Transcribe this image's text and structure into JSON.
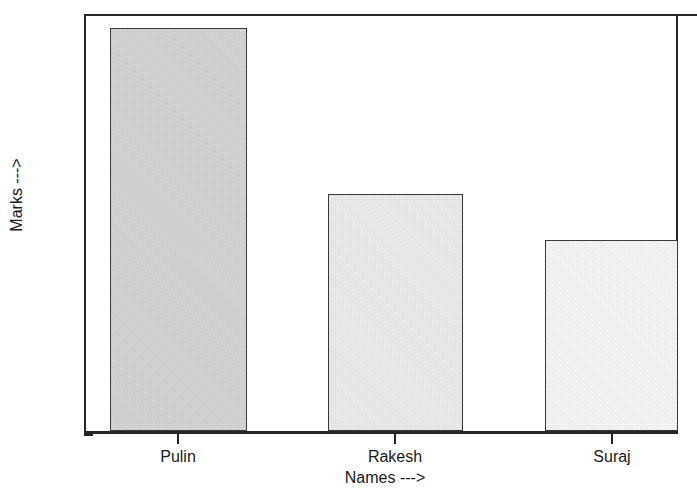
{
  "chart_data": {
    "type": "bar",
    "title": "",
    "subtitle": "",
    "categories": [
      "Pulin",
      "Rakesh",
      "Suraj"
    ],
    "values": [
      97,
      57,
      46
    ],
    "xlabel": "Names --->",
    "ylabel": "Marks --->",
    "ylim": [
      0,
      100
    ],
    "yticks": [
      0,
      20,
      40,
      60,
      80,
      100
    ],
    "ytick_labels": [
      "0",
      "20",
      "40",
      "60",
      "80",
      "100"
    ],
    "grid": false,
    "legend": null,
    "legend_position": "none",
    "bar_colors": [
      "#d9d9d9",
      "#f0f0f0",
      "#fbfbfb"
    ],
    "bar_edge_color": "#3a3a3a",
    "axis_color": "#262626",
    "background_color": "#ffffff"
  },
  "axis": {
    "x_title": "Names --->",
    "y_title": "Marks --->"
  },
  "ticks": {
    "y": [
      "100",
      "80",
      "60",
      "40",
      "20",
      "0"
    ],
    "x": [
      "Pulin",
      "Rakesh",
      "Suraj"
    ]
  }
}
